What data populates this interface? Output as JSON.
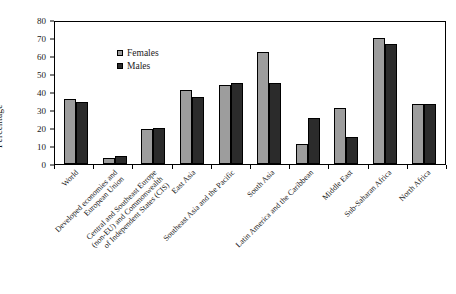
{
  "chart_data": {
    "type": "bar",
    "title": "",
    "xlabel": "",
    "ylabel": "Percentage",
    "ylim": [
      0,
      80
    ],
    "yticks": [
      0,
      10,
      20,
      30,
      40,
      50,
      60,
      70,
      80
    ],
    "grid": false,
    "legend_position": "top-left",
    "categories": [
      "World",
      "Developed economies and European Union",
      "Central and Southeast Europe (non-EU) and Commonwealth of Independent States (CIS)",
      "East Asia",
      "Southeast Asia and the Pacific",
      "South Asia",
      "Latin America and the Caribbean",
      "Middle East",
      "Sub-Saharan Africa",
      "North Africa"
    ],
    "category_lines": [
      [
        "World"
      ],
      [
        "Developed economies and",
        "European Union"
      ],
      [
        "Central and Southeast Europe",
        "(non-EU) and Commonwealth",
        "of Independent States (CIS)"
      ],
      [
        "East Asia"
      ],
      [
        "Southeast Asia and the Pacific"
      ],
      [
        "South Asia"
      ],
      [
        "Latin America and the Caribbean"
      ],
      [
        "Middle East"
      ],
      [
        "Sub-Saharan Africa"
      ],
      [
        "North Africa"
      ]
    ],
    "series": [
      {
        "name": "Females",
        "color": "#9d9d9d",
        "values": [
          36,
          3.5,
          19.5,
          41,
          44,
          62,
          11,
          31,
          70,
          33.5
        ]
      },
      {
        "name": "Males",
        "color": "#2b2b2b",
        "values": [
          34.5,
          4.5,
          20,
          37,
          45,
          45,
          25.5,
          15,
          66.5,
          33.5
        ]
      }
    ]
  },
  "legend": {
    "females_label": "Females",
    "males_label": "Males"
  },
  "axis": {
    "y_title": "Percentage"
  }
}
